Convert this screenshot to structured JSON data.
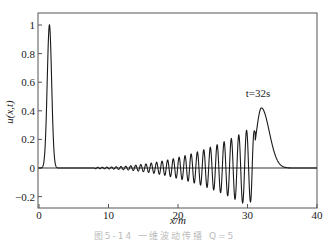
{
  "chart_data": {
    "type": "line",
    "title": "",
    "xlabel": "x/m",
    "ylabel": "u(x,t)",
    "xlim": [
      0,
      40
    ],
    "ylim": [
      -0.28,
      1.08
    ],
    "xticks": [
      0,
      10,
      20,
      30,
      40
    ],
    "xtick_labels": [
      "0",
      "10",
      "20",
      "30",
      "40"
    ],
    "yticks": [
      -0.2,
      0,
      0.2,
      0.4,
      0.6,
      0.8,
      1
    ],
    "ytick_labels": [
      "-0.2",
      "0",
      "0.2",
      "0.4",
      "0.6",
      "0.8",
      "1"
    ],
    "grid": false,
    "legend": null,
    "zero_line": true,
    "annotations": [
      {
        "text": "t=32s",
        "x": 31.5,
        "y": 0.47
      }
    ],
    "series": [
      {
        "name": "initial pulse (t=0)",
        "description": "Narrow Gaussian-like pulse centered near x=1.5, peak ≈1.0",
        "center": 1.5,
        "peak": 1.0,
        "width": 0.45
      },
      {
        "name": "t=32s",
        "description": "Leading solitary-like hump near x≈32 (peak ≈0.42) followed by a dispersive oscillatory wave train extending back to x≈8 with amplitude growing toward x≈30 (min ≈ -0.27 near x≈30)",
        "hump_center": 32,
        "hump_peak": 0.42,
        "oscillation_start": 8,
        "oscillation_end": 30.5,
        "max_trough": -0.27,
        "wave_crests": [
          {
            "x": 16,
            "y": 0.04
          },
          {
            "x": 18,
            "y": 0.06
          },
          {
            "x": 20,
            "y": 0.08
          },
          {
            "x": 22,
            "y": 0.1
          },
          {
            "x": 24,
            "y": 0.13
          },
          {
            "x": 26,
            "y": 0.17
          },
          {
            "x": 28,
            "y": 0.22
          },
          {
            "x": 29.6,
            "y": 0.27
          }
        ]
      }
    ]
  },
  "caption": "图5-14  一维波动传播 Q=5"
}
